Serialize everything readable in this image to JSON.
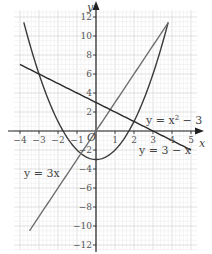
{
  "chart_data": {
    "type": "line",
    "title": "",
    "xlabel": "x",
    "ylabel": "y",
    "origin_label": "O",
    "xlim": [
      -4.3,
      5.3
    ],
    "ylim": [
      -12.5,
      12.7
    ],
    "grid": true,
    "x_ticks": [
      -4,
      -3,
      -2,
      -1,
      1,
      2,
      3,
      4,
      5
    ],
    "x_tick_labels": [
      "−4",
      "−3",
      "−2",
      "−1",
      "1",
      "2",
      "3",
      "4",
      "5"
    ],
    "y_ticks": [
      12,
      10,
      8,
      6,
      4,
      2,
      -2,
      -4,
      -6,
      -8,
      -10,
      -12
    ],
    "y_tick_labels": [
      "12",
      "10",
      "8",
      "6",
      "4",
      "2",
      "−2",
      "−4",
      "−6",
      "−8",
      "−10",
      "−12"
    ],
    "series": [
      {
        "name": "y = x² − 3",
        "label": "y = x² − 3",
        "expression": "x^2 - 3",
        "x_range": [
          -3.8,
          3.8
        ],
        "color": "#3a3a3a"
      },
      {
        "name": "y = 3x",
        "label": "y = 3x",
        "expression": "3x",
        "x_range": [
          -3.5,
          3.8
        ],
        "color": "#707070"
      },
      {
        "name": "y = 3 − x",
        "label": "y = 3 − x",
        "expression": "3 - x",
        "x_range": [
          -4,
          5
        ],
        "color": "#2a2a2a"
      }
    ]
  },
  "labels": {
    "x_axis": "x",
    "y_axis": "y",
    "origin": "O",
    "eq_parabola_main": "y = x",
    "eq_parabola_exp": "2",
    "eq_parabola_tail": " − 3",
    "eq_3x": "y = 3x",
    "eq_3minusx": "y = 3 − x"
  }
}
